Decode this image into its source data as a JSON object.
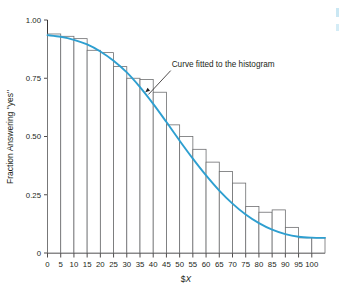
{
  "chart_data": {
    "type": "bar",
    "title": "",
    "subtitle": "",
    "xlabel": "$X",
    "xlabel_prefix": "$",
    "xlabel_italic": "X",
    "ylabel": "Fraction Answering \"yes\"",
    "xlim": [
      0,
      105
    ],
    "ylim": [
      0,
      1.0
    ],
    "grid": false,
    "legend": null,
    "bar_width": 5,
    "bar_align": "left-edge-at-category",
    "categories": [
      0,
      5,
      10,
      15,
      20,
      25,
      30,
      35,
      40,
      45,
      50,
      55,
      60,
      65,
      70,
      75,
      80,
      85,
      90,
      95,
      100
    ],
    "values": [
      0.94,
      0.93,
      0.92,
      0.87,
      0.86,
      0.8,
      0.75,
      0.745,
      0.69,
      0.55,
      0.5,
      0.445,
      0.39,
      0.35,
      0.3,
      0.2,
      0.175,
      0.185,
      0.11,
      0.065,
      0.065
    ],
    "xticks": [
      0,
      5,
      10,
      15,
      20,
      25,
      30,
      35,
      40,
      45,
      50,
      55,
      60,
      65,
      70,
      75,
      80,
      85,
      90,
      95,
      100
    ],
    "xticklabels": [
      "0",
      "5",
      "10",
      "15",
      "20",
      "25",
      "30",
      "35",
      "40",
      "45",
      "50",
      "55",
      "60",
      "65",
      "70",
      "75",
      "80",
      "85",
      "90",
      "95",
      "100"
    ],
    "yticks": [
      0,
      0.25,
      0.5,
      0.75,
      1.0
    ],
    "yticklabels": [
      "0",
      "0.25",
      "0.50",
      "0.75",
      "1.00"
    ],
    "series": [
      {
        "name": "Histogram",
        "kind": "bar",
        "color": "#6e6f71",
        "fill": "#ffffff",
        "values": [
          0.94,
          0.93,
          0.92,
          0.87,
          0.86,
          0.8,
          0.75,
          0.745,
          0.69,
          0.55,
          0.5,
          0.445,
          0.39,
          0.35,
          0.3,
          0.2,
          0.175,
          0.185,
          0.11,
          0.065,
          0.065
        ]
      },
      {
        "name": "Curve fitted to the histogram",
        "kind": "line",
        "color": "#2e9fd0",
        "x": [
          0,
          5,
          10,
          15,
          20,
          25,
          30,
          35,
          40,
          45,
          50,
          55,
          60,
          65,
          70,
          75,
          80,
          85,
          90,
          95,
          100,
          105
        ],
        "y": [
          0.935,
          0.928,
          0.915,
          0.895,
          0.865,
          0.825,
          0.775,
          0.712,
          0.64,
          0.562,
          0.482,
          0.405,
          0.333,
          0.268,
          0.212,
          0.165,
          0.128,
          0.1,
          0.081,
          0.07,
          0.066,
          0.065
        ]
      }
    ],
    "annotations": [
      {
        "text": "Curve fitted to the histogram",
        "text_x": 47,
        "text_y": 0.8,
        "arrow_target_x": 37,
        "arrow_target_y": 0.69,
        "color": "#231f20"
      }
    ],
    "colors": {
      "curve": "#2e9fd0",
      "bar_stroke": "#6e6f71",
      "bar_fill": "#ffffff",
      "axis": "#231f20",
      "text": "#231f20",
      "corner_marks": "#9fd4ea",
      "background": "#ffffff"
    }
  }
}
